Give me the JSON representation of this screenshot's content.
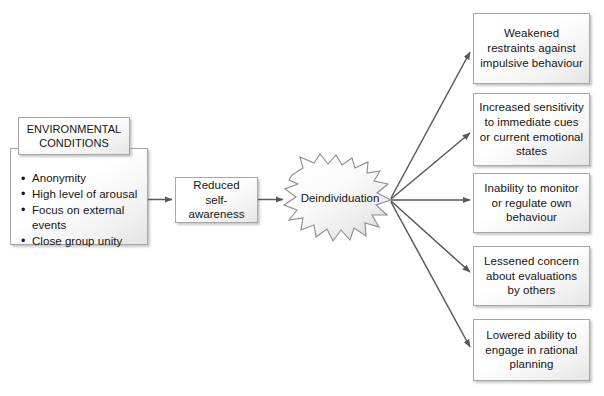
{
  "diagram": {
    "environmental": {
      "header": "ENVIRONMENTAL CONDITIONS",
      "header_line1": "ENVIRONMENTAL",
      "header_line2": "CONDITIONS",
      "bullets": [
        "Anonymity",
        "High level of arousal",
        "Focus on external events",
        "Close group unity"
      ]
    },
    "reduced": {
      "label": "Reduced self-awareness",
      "line1": "Reduced",
      "line2": "self-awareness"
    },
    "central": {
      "label": "Deindividuation"
    },
    "outcomes": [
      {
        "label": "Weakened restraints against impulsive behaviour"
      },
      {
        "label": "Increased sensitivity to immediate cues or current emotional states"
      },
      {
        "label": "Inability to monitor or regulate own behaviour"
      },
      {
        "label": "Lessened concern about evaluations by others"
      },
      {
        "label": "Lowered ability to engage in rational planning"
      }
    ],
    "colors": {
      "background": "#ffffff",
      "box_border": "#a6a6a6",
      "box_fill": "#f4f4f4",
      "text": "#151515",
      "arrow": "#595959"
    }
  }
}
